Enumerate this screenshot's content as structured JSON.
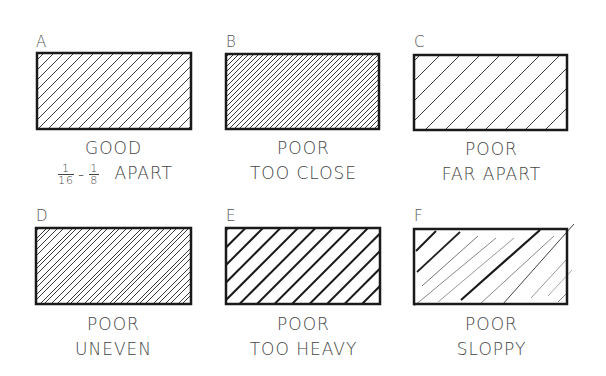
{
  "panels": [
    {
      "id": "A",
      "letter": "A",
      "line1": "GOOD",
      "line2": "APART",
      "fraction_range": {
        "from_num": "1",
        "from_den": "16",
        "sep": "-",
        "to_num": "1",
        "to_den": "8"
      },
      "hatch": {
        "spacing": 10,
        "stroke": "#3a3a3a",
        "width": 1,
        "style": "good"
      }
    },
    {
      "id": "B",
      "letter": "B",
      "line1": "POOR",
      "line2": "TOO CLOSE",
      "hatch": {
        "spacing": 5,
        "stroke": "#3a3a3a",
        "width": 1,
        "style": "too-close"
      }
    },
    {
      "id": "C",
      "letter": "C",
      "line1": "POOR",
      "line2": "FAR APART",
      "hatch": {
        "spacing": 20,
        "stroke": "#3a3a3a",
        "width": 1,
        "style": "far-apart"
      }
    },
    {
      "id": "D",
      "letter": "D",
      "line1": "POOR",
      "line2": "UNEVEN",
      "hatch": {
        "spacing": "irregular",
        "stroke": "#3a3a3a",
        "width": 1,
        "style": "uneven"
      }
    },
    {
      "id": "E",
      "letter": "E",
      "line1": "POOR",
      "line2": "TOO HEAVY",
      "hatch": {
        "spacing": 10,
        "stroke": "#1a1a1a",
        "width": 2,
        "style": "too-heavy"
      }
    },
    {
      "id": "F",
      "letter": "F",
      "line1": "POOR",
      "line2": "SLOPPY",
      "hatch": {
        "spacing": "irregular",
        "stroke": "mixed",
        "width": "mixed",
        "style": "sloppy"
      }
    }
  ],
  "colors": {
    "border": "#1a1a1a",
    "text": "#444444",
    "background": "#ffffff"
  }
}
